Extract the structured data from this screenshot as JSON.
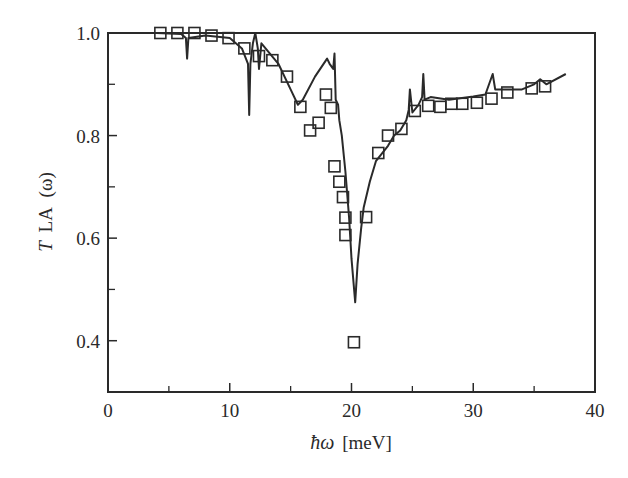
{
  "chart_data": {
    "type": "line",
    "title": "",
    "xlabel": "ħω [meV]",
    "ylabel": "T_LA (ω)",
    "ylabel_parts": {
      "main": "T",
      "sub": "LA",
      "arg": "(ω)"
    },
    "xlabel_parts": {
      "main": "ħω",
      "unit": "[meV]"
    },
    "xlim": [
      0,
      40
    ],
    "ylim": [
      0.3,
      1.0
    ],
    "xticks": [
      0,
      10,
      20,
      30,
      40
    ],
    "xtick_labels": [
      "0",
      "10",
      "20",
      "30",
      "40"
    ],
    "xminor": [
      5,
      15,
      25,
      35
    ],
    "yticks": [
      0.4,
      0.6,
      0.8,
      1.0
    ],
    "ytick_labels": [
      "0.4",
      "0.6",
      "0.8",
      "1.0"
    ],
    "yminor": [
      0.5,
      0.7,
      0.9
    ],
    "grid": false,
    "legend": null,
    "series": [
      {
        "name": "calculated",
        "style": "solid line",
        "x": [
          0.0,
          4.0,
          6.0,
          6.4,
          6.5,
          6.6,
          8.0,
          10.0,
          11.0,
          11.5,
          11.6,
          11.7,
          11.9,
          12.1,
          12.3,
          12.4,
          12.6,
          14.0,
          15.0,
          15.6,
          16.0,
          17.0,
          18.0,
          18.2,
          18.5,
          18.6,
          18.7,
          18.9,
          19.0,
          19.2,
          19.5,
          19.8,
          20.0,
          20.3,
          20.5,
          20.8,
          21.0,
          21.5,
          22.0,
          23.0,
          23.5,
          24.0,
          24.5,
          24.7,
          24.8,
          25.0,
          25.5,
          25.8,
          25.9,
          26.0,
          26.5,
          28.0,
          30.0,
          31.0,
          31.6,
          31.8,
          32.0,
          34.0,
          35.0,
          35.5,
          36.0,
          37.6
        ],
        "y": [
          1.0,
          1.0,
          0.998,
          0.99,
          0.95,
          0.99,
          0.995,
          0.99,
          0.97,
          0.94,
          0.84,
          0.94,
          0.98,
          1.0,
          0.97,
          0.93,
          0.98,
          0.94,
          0.89,
          0.86,
          0.87,
          0.915,
          0.95,
          0.94,
          0.93,
          0.96,
          0.87,
          0.86,
          0.83,
          0.8,
          0.73,
          0.64,
          0.56,
          0.475,
          0.55,
          0.62,
          0.66,
          0.71,
          0.75,
          0.78,
          0.8,
          0.81,
          0.83,
          0.85,
          0.89,
          0.845,
          0.86,
          0.875,
          0.92,
          0.87,
          0.875,
          0.87,
          0.876,
          0.88,
          0.92,
          0.89,
          0.89,
          0.89,
          0.9,
          0.91,
          0.9,
          0.92
        ]
      },
      {
        "name": "experimental",
        "style": "open squares",
        "x": [
          4.3,
          5.7,
          7.1,
          8.5,
          9.9,
          11.2,
          12.4,
          13.5,
          14.7,
          15.8,
          16.6,
          17.3,
          17.9,
          18.3,
          18.6,
          19.0,
          19.3,
          19.5,
          19.5,
          20.2,
          21.2,
          22.2,
          23.0,
          24.1,
          25.2,
          26.3,
          27.3,
          28.2,
          29.1,
          30.3,
          31.5,
          32.8,
          34.8,
          35.9
        ],
        "y": [
          1.0,
          1.0,
          1.0,
          0.995,
          0.99,
          0.97,
          0.955,
          0.947,
          0.915,
          0.856,
          0.81,
          0.825,
          0.88,
          0.854,
          0.74,
          0.71,
          0.68,
          0.64,
          0.606,
          0.397,
          0.641,
          0.766,
          0.8,
          0.813,
          0.848,
          0.858,
          0.856,
          0.862,
          0.862,
          0.864,
          0.872,
          0.884,
          0.892,
          0.896
        ]
      }
    ]
  }
}
